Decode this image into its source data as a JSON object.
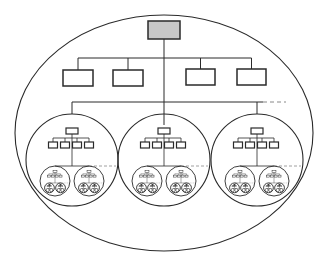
{
  "diagram": {
    "type": "nested-hierarchy",
    "colors": {
      "stroke": "#2a2a2a",
      "root_fill": "#c8c8c8",
      "node_fill": "#ffffff",
      "dashed": "#888888",
      "background": "#ffffff"
    },
    "outer_boundary": {
      "shape": "ellipse",
      "cx": 164,
      "cy": 133,
      "rx": 149,
      "ry": 118
    },
    "root": {
      "x": 148,
      "y": 21,
      "w": 32,
      "h": 18,
      "filled": true
    },
    "level2": {
      "bus_y": 58,
      "nodes": [
        {
          "x": 63,
          "y": 70,
          "w": 30,
          "h": 16
        },
        {
          "x": 113,
          "y": 70,
          "w": 30,
          "h": 16
        },
        {
          "x": 186,
          "y": 69,
          "w": 29,
          "h": 16
        },
        {
          "x": 237,
          "y": 69,
          "w": 29,
          "h": 16
        }
      ]
    },
    "subunit_bus": {
      "y": 102,
      "x1": 72,
      "x2": 257,
      "dashed_extension_to": 286
    },
    "subunits": [
      {
        "cx": 72,
        "cy": 160,
        "r": 46
      },
      {
        "cx": 164,
        "cy": 160,
        "r": 46
      },
      {
        "cx": 257,
        "cy": 160,
        "r": 46
      }
    ]
  }
}
